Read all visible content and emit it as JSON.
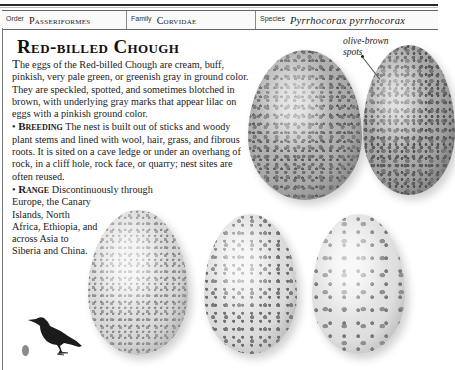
{
  "taxonomy": {
    "order": {
      "label": "Order",
      "value": "Passeriformes"
    },
    "family": {
      "label": "Family",
      "value": "Corvidae"
    },
    "species": {
      "label": "Species",
      "value": "Pyrrhocorax pyrrhocorax"
    }
  },
  "entry": {
    "title": "Red-billed Chough",
    "intro_dropcap": "T",
    "intro": "he eggs of the Red-billed Chough are cream, buff, pinkish, very pale green, or greenish gray in ground color. They are  speckled, spotted, and sometimes blotched in brown, with underlying gray marks that appear lilac on eggs with a pinkish ground color.",
    "breeding_heading": "Breeding",
    "breeding_text": " The nest is built out of sticks and woody plant stems and lined with wool, hair, grass, and fibrous roots. It is sited on a cave ledge or under an overhang of rock, in a cliff hole, rock face, or quarry; nest sites are often reused.",
    "range_heading": "Range",
    "range_text_1": " Discontinuously through",
    "range_text_2": "Europe, the Canary Islands, North Africa, Ethiopia, and across Asia to Siberia and China.",
    "bullet": "•"
  },
  "callout": {
    "line1": "olive-brown",
    "line2": "spots"
  },
  "images": {
    "eggs": [
      "egg-1",
      "egg-2",
      "egg-3",
      "egg-4",
      "egg-5"
    ],
    "bird": "red-billed-chough-silhouette",
    "scale_egg": "egg-size-indicator"
  }
}
